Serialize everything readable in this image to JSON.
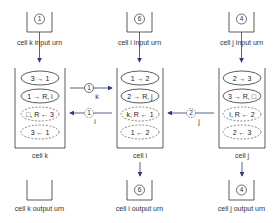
{
  "colors": {
    "line": "#333333",
    "arrow": "#2d3a7a",
    "dashed": "#555555"
  },
  "cells": [
    {
      "id": "k",
      "label": "cell k",
      "input_urn": {
        "label": "cell k input urn",
        "count": "1"
      },
      "output_urn": {
        "label": "cell k output urn",
        "count": ""
      },
      "tokens": [
        {
          "text": "3 → 1",
          "style": "solid"
        },
        {
          "text": "1 → R, i",
          "style": "solid"
        },
        {
          "text": "□, R ← 3",
          "style": "dashed"
        },
        {
          "text": "3 ← 1",
          "style": "dashed"
        }
      ]
    },
    {
      "id": "i",
      "label": "cell i",
      "input_urn": {
        "label": "cell i input urn",
        "count": "6"
      },
      "output_urn": {
        "label": "cell i output urn",
        "count": "6"
      },
      "tokens": [
        {
          "text": "1 → 2",
          "style": "solid"
        },
        {
          "text": "2 → R, j",
          "style": "solid"
        },
        {
          "text": "k, R ← 1",
          "style": "dashed"
        },
        {
          "text": "1 ← 2",
          "style": "dashed"
        }
      ]
    },
    {
      "id": "j",
      "label": "cell j",
      "input_urn": {
        "label": "cell j input urn",
        "count": "4"
      },
      "output_urn": {
        "label": "cell j output urn",
        "count": "4"
      },
      "tokens": [
        {
          "text": "2 → 3",
          "style": "solid"
        },
        {
          "text": "3 → R, □",
          "style": "solid"
        },
        {
          "text": "i, R ← 2",
          "style": "dashed"
        },
        {
          "text": "2 ← 3",
          "style": "dashed"
        }
      ]
    }
  ],
  "messages": [
    {
      "from": "k",
      "to": "i",
      "value": "1",
      "label": "k",
      "style": "solid"
    },
    {
      "from": "i",
      "to": "k",
      "value": "1",
      "label": "i",
      "style": "dashed"
    },
    {
      "from": "j",
      "to": "i",
      "value": "2",
      "label": "j",
      "style": "dashed"
    }
  ]
}
